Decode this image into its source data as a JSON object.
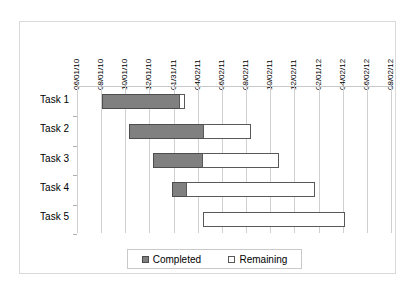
{
  "chart_data": {
    "type": "bar",
    "subtype": "gantt-stacked-horizontal",
    "title": "",
    "xlabel": "",
    "ylabel": "",
    "grid": true,
    "legend_position": "bottom",
    "categories": [
      "Task 1",
      "Task 2",
      "Task 3",
      "Task 4",
      "Task 5"
    ],
    "x_tick_labels": [
      "06/01/10",
      "08/01/10",
      "10/01/10",
      "12/01/10",
      "01/31/11",
      "04/02/11",
      "06/02/11",
      "08/02/11",
      "10/02/11",
      "12/02/11",
      "02/01/12",
      "04/02/12",
      "06/02/12",
      "08/02/12"
    ],
    "xlim": [
      0,
      13
    ],
    "series": [
      {
        "name": "Completed",
        "color": "#808080",
        "values": [
          3.2,
          3.1,
          2.05,
          0.6,
          0
        ]
      },
      {
        "name": "Remaining",
        "color": "#FFFFFF",
        "values": [
          0.25,
          2.0,
          3.2,
          5.35,
          5.9
        ]
      }
    ],
    "offsets": {
      "name": "Start",
      "values": [
        1.05,
        2.15,
        3.15,
        3.95,
        5.2
      ]
    },
    "bars": [
      {
        "task": "Task 1",
        "start": 1.05,
        "completed": 3.2,
        "remaining": 0.25,
        "start_date": "08/01/10",
        "end_date": "02/20/11"
      },
      {
        "task": "Task 2",
        "start": 2.15,
        "completed": 3.1,
        "remaining": 2.0,
        "start_date": "10/06/10",
        "end_date": "08/20/11"
      },
      {
        "task": "Task 3",
        "start": 3.15,
        "completed": 2.05,
        "remaining": 3.2,
        "start_date": "12/07/10",
        "end_date": "11/20/11"
      },
      {
        "task": "Task 4",
        "start": 3.95,
        "completed": 0.6,
        "remaining": 5.35,
        "start_date": "01/28/11",
        "end_date": "04/20/12"
      },
      {
        "task": "Task 5",
        "start": 5.2,
        "completed": 0,
        "remaining": 5.9,
        "start_date": "05/10/11",
        "end_date": "06/25/12"
      }
    ]
  },
  "legend": {
    "entries": [
      {
        "label": "Completed",
        "swatch": "completed-swatch-icon"
      },
      {
        "label": "Remaining",
        "swatch": "remaining-swatch-icon"
      }
    ]
  }
}
